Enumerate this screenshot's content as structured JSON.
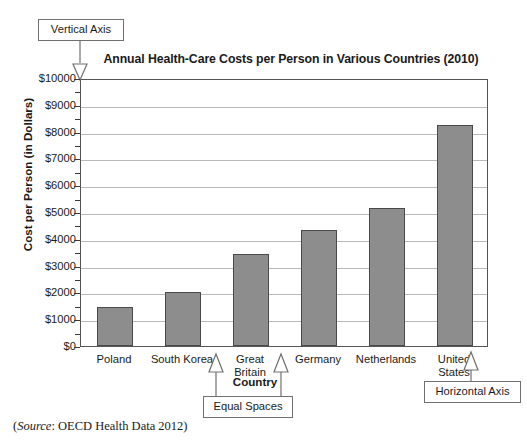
{
  "chart_data": {
    "type": "bar",
    "title": "Annual Health-Care Costs per Person in Various Countries (2010)",
    "xlabel": "Country",
    "ylabel": "Cost per Person (in Dollars)",
    "categories": [
      "Poland",
      "South Korea",
      "Great\nBritain",
      "Germany",
      "Netherlands",
      "United\nStates"
    ],
    "values": [
      1450,
      2010,
      3430,
      4330,
      5150,
      8250
    ],
    "ylim": [
      0,
      10000
    ],
    "ytick_labels": [
      "$10000",
      "$9000",
      "$8000",
      "$7000",
      "$6000",
      "$5000",
      "$4000",
      "$3000",
      "$2000",
      "$1000",
      "$0"
    ],
    "ytick_values": [
      10000,
      9000,
      8000,
      7000,
      6000,
      5000,
      4000,
      3000,
      2000,
      1000,
      0
    ],
    "minor_tick_step": 500,
    "grid": true,
    "legend": "none",
    "bar_color": "#8d8d8d",
    "bar_edge_color": "#4a4a4a",
    "gridline_color": "#b9b9b9",
    "axis_color": "#555555"
  },
  "annotations": {
    "vertical_axis": "Vertical Axis",
    "horizontal_axis": "Horizontal Axis",
    "equal_spaces": "Equal Spaces"
  },
  "source": {
    "open_paren": "(",
    "label": "Source",
    "text": ": OECD Health Data 2012)"
  }
}
